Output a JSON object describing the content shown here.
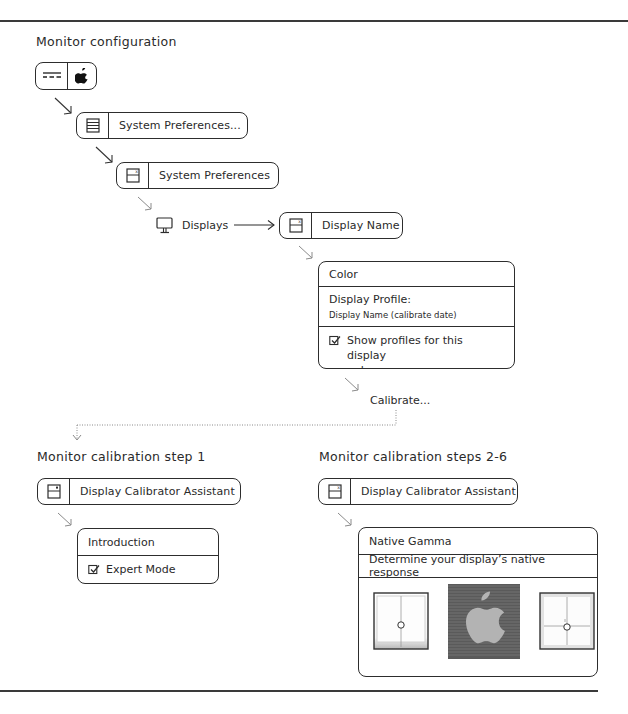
{
  "sections": {
    "config_title": "Monitor configuration",
    "step1_title": "Monitor calibration step 1",
    "steps26_title": "Monitor calibration steps 2-6"
  },
  "nodes": {
    "apple_menu": {
      "icons": [
        "menu-bar-icon",
        "apple-logo-icon"
      ]
    },
    "system_prefs_menu": {
      "icon": "list-icon",
      "label": "System Preferences..."
    },
    "system_prefs_window": {
      "icon": "window-icon",
      "label": "System Preferences"
    },
    "displays": {
      "icon": "monitor-icon",
      "label": "Displays"
    },
    "display_name_window": {
      "icon": "window-icon",
      "label": "Display Name"
    },
    "color_panel": {
      "tab": "Color",
      "profile_label": "Display Profile:",
      "profile_value": "Display Name (calibrate date)",
      "checkbox_label_line1": "Show profiles for this display",
      "checkbox_label_line2": "only",
      "checkbox_checked": true
    },
    "calibrate": {
      "label": "Calibrate..."
    },
    "calibrator_step1": {
      "icon": "window-icon",
      "label": "Display Calibrator Assistant"
    },
    "intro_panel": {
      "title": "Introduction",
      "checkbox_label": "Expert Mode",
      "checkbox_checked": true
    },
    "calibrator_steps26": {
      "icon": "window-icon",
      "label": "Display Calibrator Assistant"
    },
    "gamma_panel": {
      "title": "Native Gamma",
      "subtitle": "Determine your display’s native response",
      "images": [
        "gamma-slider-left",
        "apple-striped-pattern",
        "gamma-slider-right"
      ]
    }
  },
  "colors": {
    "stroke": "#2d2d2d",
    "text": "#2a2a2a",
    "arrow_light": "#8a8a8a",
    "pattern_dark": "#5a5a5a",
    "apple_gray": "#b3b3b3"
  }
}
